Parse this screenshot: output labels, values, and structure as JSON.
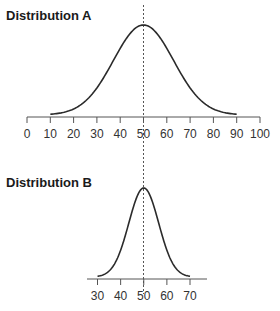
{
  "chart_data": [
    {
      "type": "line",
      "title": "Distribution A",
      "description": "Normal distribution curve centered at 50, spanning roughly 10 to 90",
      "mean": 50,
      "x_range": [
        10,
        90
      ],
      "xlim": [
        0,
        100
      ],
      "ticks": [
        0,
        10,
        20,
        30,
        40,
        50,
        60,
        70,
        80,
        90,
        100
      ],
      "tick_labels": [
        "0",
        "10",
        "20",
        "30",
        "40",
        "50",
        "60",
        "70",
        "80",
        "90",
        "100"
      ],
      "reference_line": {
        "x": 50,
        "style": "dashed"
      },
      "xlabel": "",
      "ylabel": ""
    },
    {
      "type": "line",
      "title": "Distribution B",
      "description": "Narrower normal distribution curve centered at 50, spanning roughly 30 to 70",
      "mean": 50,
      "x_range": [
        30,
        70
      ],
      "xlim": [
        30,
        70
      ],
      "ticks": [
        30,
        40,
        50,
        60,
        70
      ],
      "tick_labels": [
        "30",
        "40",
        "50",
        "60",
        "70"
      ],
      "reference_line": {
        "x": 50,
        "style": "dashed"
      },
      "xlabel": "",
      "ylabel": ""
    }
  ],
  "titles": {
    "a": "Distribution A",
    "b": "Distribution B"
  },
  "colors": {
    "curve": "#2b2b2b",
    "axis": "#555555",
    "dashed_line": "#555555"
  }
}
